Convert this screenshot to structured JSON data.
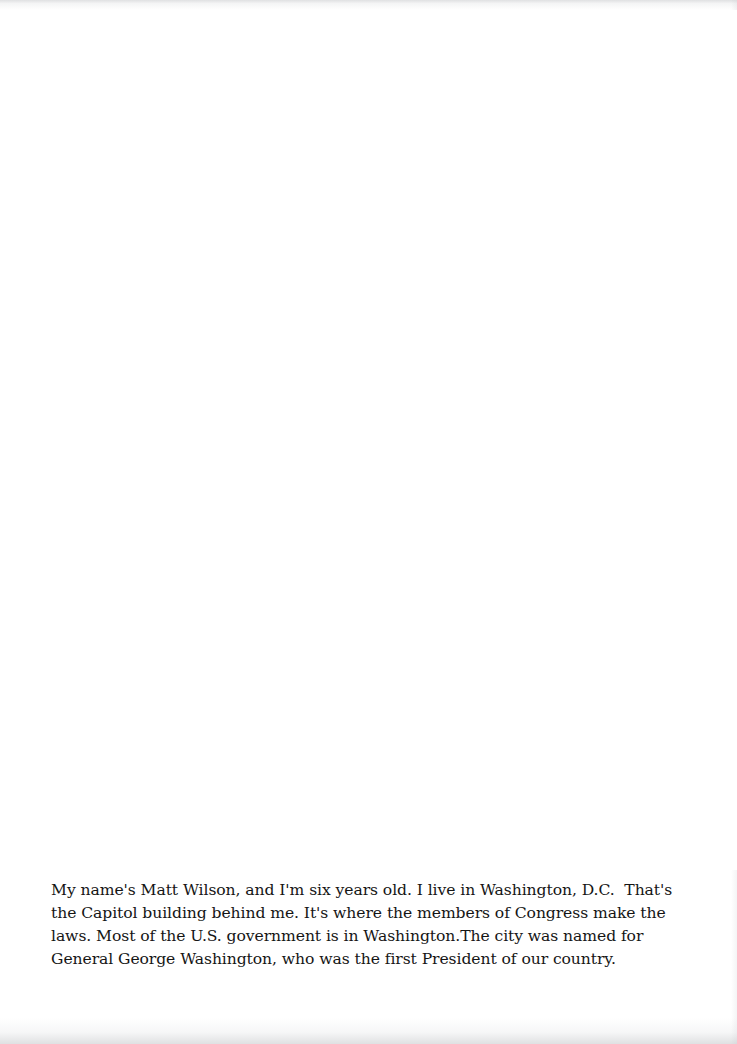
{
  "page": {
    "kind": "scanned-book-page",
    "background_color": "#ffffff",
    "text_color": "#151515"
  },
  "illustration": {
    "region_label": "photograph area (blank in this scan)"
  },
  "caption": {
    "full_text": "My name's Matt Wilson, and I'm six years old. I live in Washington, D.C.  That's the Capitol building behind me. It's where the members of Congress make the laws. Most of the U.S. government is in Washington.The city was named for General George Washington, who was the first President of our country.",
    "lines": [
      "My name's Matt Wilson, and I'm six years old. I live in Washington, D.C.  That's",
      "the Capitol building behind me. It's where the members of Congress make the",
      "laws. Most of the U.S. government is in Washington.The city was named for",
      "General George Washington, who was the first President of our country."
    ]
  }
}
